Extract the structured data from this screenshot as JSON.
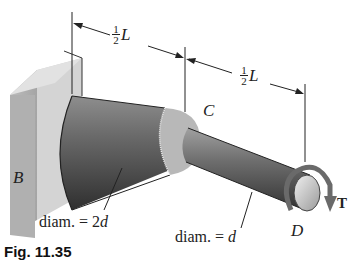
{
  "figure": {
    "dimension_left": {
      "num": "1",
      "den": "2",
      "var": "L"
    },
    "dimension_right": {
      "num": "1",
      "den": "2",
      "var": "L"
    },
    "point_B": "B",
    "point_C": "C",
    "point_D": "D",
    "torque_label": "T",
    "large_diameter_label": "diam. = 2",
    "large_diameter_var": "d",
    "small_diameter_label": "diam. = ",
    "small_diameter_var": "d",
    "caption": "Fig. 11.35"
  },
  "colors": {
    "shaft_dark": "#3c3c3c",
    "shaft_light": "#9a9a9a",
    "wall": "#c8c8c8",
    "torque_arrow": "#6a6a6a"
  }
}
